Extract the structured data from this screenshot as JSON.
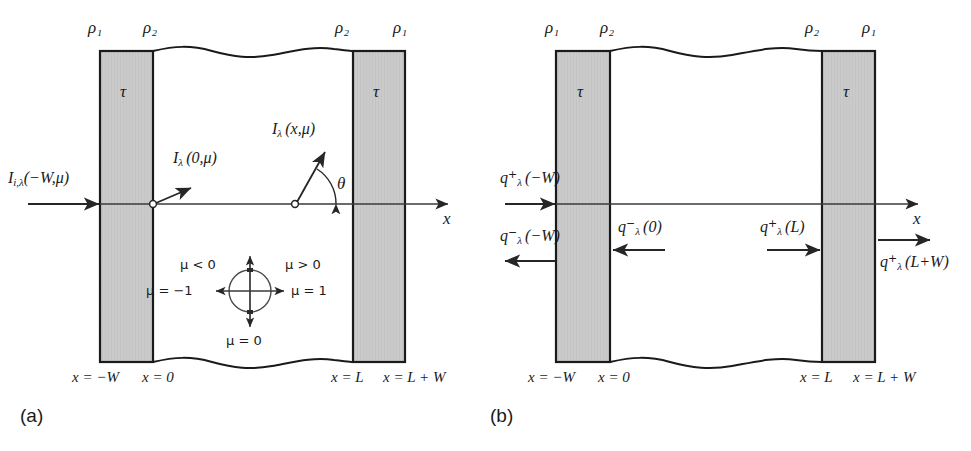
{
  "figure": {
    "kind": "two-panel radiative-transfer slab diagram",
    "colors": {
      "slab_fill": "#c9c9c9",
      "slab_stroke": "#1a1a1a",
      "line": "#333333",
      "text": "#1a1a1a",
      "background": "#ffffff"
    }
  },
  "panel_a": {
    "tag": "(a)",
    "interface_labels": {
      "outer_left": "ρ₁",
      "inner_left": "ρ₂",
      "inner_right": "ρ₂",
      "outer_right": "ρ₁"
    },
    "slab_left_label": "τ",
    "slab_right_label": "τ",
    "incident_intensity": "I",
    "incident_intensity_sub": "i,λ",
    "incident_intensity_arg": "(−W,μ)",
    "intensity_at_zero": "I",
    "intensity_at_zero_sub": "λ",
    "intensity_at_zero_arg": "(0,μ)",
    "intensity_at_x": "I",
    "intensity_at_x_sub": "λ",
    "intensity_at_x_arg": "(x,μ)",
    "angle_label": "θ",
    "axis_label": "x",
    "direction_circle": {
      "up": "μ < 0",
      "up_right": "μ > 0",
      "left": "μ = −1",
      "right": "μ = 1",
      "down": "μ = 0"
    },
    "x_ticks": {
      "minus_w": "x = −W",
      "zero": "x = 0",
      "l": "x = L",
      "l_plus_w": "x = L + W"
    }
  },
  "panel_b": {
    "tag": "(b)",
    "interface_labels": {
      "outer_left": "ρ₁",
      "inner_left": "ρ₂",
      "inner_right": "ρ₂",
      "outer_right": "ρ₁"
    },
    "slab_left_label": "τ",
    "slab_right_label": "τ",
    "flux_in_left": {
      "base": "q",
      "sup": "+",
      "sub": "λ",
      "arg": "(−W)"
    },
    "flux_out_left": {
      "base": "q",
      "sup": "−",
      "sub": "λ",
      "arg": "(−W)"
    },
    "flux_back_zero": {
      "base": "q",
      "sup": "−",
      "sub": "λ",
      "arg": "(0)"
    },
    "flux_fwd_l": {
      "base": "q",
      "sup": "+",
      "sub": "λ",
      "arg": "(L)"
    },
    "flux_out_right": {
      "base": "q",
      "sup": "+",
      "sub": "λ",
      "arg": "(L+W)"
    },
    "axis_label": "x",
    "x_ticks": {
      "minus_w": "x = −W",
      "zero": "x = 0",
      "l": "x = L",
      "l_plus_w": "x = L + W"
    }
  }
}
